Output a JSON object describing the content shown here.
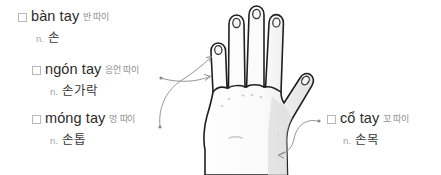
{
  "page": {
    "background_color": "#ffffff",
    "term_color": "#2b2b2b",
    "pronunciation_color": "#8d8d8d",
    "pos_color": "#a2a2a2",
    "meaning_color": "#3a3a3a",
    "arrow_color": "#8a8a8a",
    "outline_color": "#1f1f1f"
  },
  "labels": [
    {
      "id": "ban-tay",
      "term": "bàn tay",
      "pronunciation": "반 따이",
      "pos": "n.",
      "meaning": "손",
      "has_arrow": false
    },
    {
      "id": "ngon-tay",
      "term": "ngón tay",
      "pronunciation": "응언 따이",
      "pos": "n.",
      "meaning": "손가락",
      "has_arrow": true
    },
    {
      "id": "mong-tay",
      "term": "móng tay",
      "pronunciation": "멍 따이",
      "pos": "n.",
      "meaning": "손톱",
      "has_arrow": true
    },
    {
      "id": "co-tay",
      "term": "cổ tay",
      "pronunciation": "꼬 따이",
      "pos": "n.",
      "meaning": "손목",
      "has_arrow": true
    }
  ],
  "illustration": {
    "name": "open-left-hand-palm-drawing",
    "description": "Line drawing of an open hand, palm facing viewer, five fingers spread, with fingernails and faint palm shading"
  }
}
